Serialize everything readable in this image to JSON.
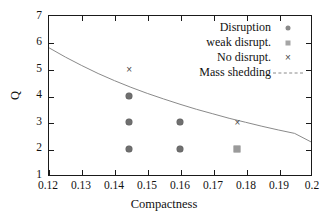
{
  "chart_data": {
    "type": "scatter",
    "title": "",
    "xlabel": "Compactness",
    "ylabel": "Q",
    "xlim": [
      0.12,
      0.2
    ],
    "ylim": [
      1,
      7
    ],
    "xticks": [
      "0.12",
      "0.13",
      "0.14",
      "0.15",
      "0.16",
      "0.17",
      "0.18",
      "0.19",
      "0.2"
    ],
    "xtick_values": [
      0.12,
      0.13,
      0.14,
      0.15,
      0.16,
      0.17,
      0.18,
      0.19,
      0.2
    ],
    "yticks": [
      "1",
      "2",
      "3",
      "4",
      "5",
      "6",
      "7"
    ],
    "ytick_values": [
      1,
      2,
      3,
      4,
      5,
      6,
      7
    ],
    "grid": false,
    "legend_position": "top-right",
    "series": [
      {
        "name": "Disruption",
        "marker": "filled-circle",
        "color": "#6f6f6f",
        "points": [
          {
            "x": 0.1445,
            "y": 4
          },
          {
            "x": 0.1445,
            "y": 3
          },
          {
            "x": 0.1445,
            "y": 2
          },
          {
            "x": 0.16,
            "y": 3
          },
          {
            "x": 0.16,
            "y": 2
          }
        ]
      },
      {
        "name": "weak disrupt.",
        "marker": "filled-square",
        "color": "#9a9a9a",
        "points": [
          {
            "x": 0.1775,
            "y": 2
          }
        ]
      },
      {
        "name": "No disrupt.",
        "marker": "cross",
        "color": "#4a4a4a",
        "glyph": "×",
        "points": [
          {
            "x": 0.1445,
            "y": 5
          },
          {
            "x": 0.1775,
            "y": 3
          }
        ]
      },
      {
        "name": "Mass shedding",
        "marker": "dashed-line",
        "color": "#8a8a8a",
        "points": [
          {
            "x": 0.12,
            "y": 5.8
          },
          {
            "x": 0.125,
            "y": 5.45
          },
          {
            "x": 0.13,
            "y": 5.13
          },
          {
            "x": 0.135,
            "y": 4.83
          },
          {
            "x": 0.14,
            "y": 4.56
          },
          {
            "x": 0.145,
            "y": 4.31
          },
          {
            "x": 0.15,
            "y": 4.08
          },
          {
            "x": 0.155,
            "y": 3.87
          },
          {
            "x": 0.16,
            "y": 3.67
          },
          {
            "x": 0.165,
            "y": 3.48
          },
          {
            "x": 0.17,
            "y": 3.31
          },
          {
            "x": 0.175,
            "y": 3.14
          },
          {
            "x": 0.18,
            "y": 2.99
          },
          {
            "x": 0.185,
            "y": 2.84
          },
          {
            "x": 0.19,
            "y": 2.7
          },
          {
            "x": 0.195,
            "y": 2.57
          },
          {
            "x": 0.2,
            "y": 2.25
          }
        ]
      }
    ]
  },
  "legend": {
    "entries": [
      {
        "label": "Disruption",
        "marker": "filled-circle"
      },
      {
        "label": "weak disrupt.",
        "marker": "filled-square"
      },
      {
        "label": "No disrupt.",
        "marker": "cross"
      },
      {
        "label": "Mass shedding",
        "marker": "dashed-line"
      }
    ]
  },
  "glyphs": {
    "cross": "×"
  }
}
